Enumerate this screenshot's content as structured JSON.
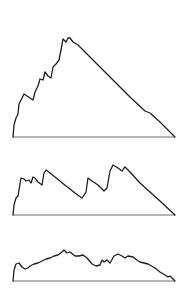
{
  "diagram": {
    "stroke_color": "#1e1e1e",
    "baseline_color": "#6e6e6e",
    "background": "#ffffff",
    "profiles": [
      {
        "name": "tall-excursion",
        "baseline": {
          "x1": 13,
          "x2": 175,
          "y": 137
        },
        "points": "13,137 14,125 16,118 18,114 19,104 24,94 33,100 35,92 38,86 40,79 43,80 45,72 48,76 51,78 53,67 56,64 59,60 61,50 63,39 66,42 68,38 70,38 73,42 78,45 90,57 110,77 130,97 145,111 150,113 160,122 175,137"
      },
      {
        "name": "medium-excursion",
        "baseline": {
          "x1": 13,
          "x2": 175,
          "y": 215
        },
        "points": "13,215 14,205 16,198 18,196 21,178 24,179 26,181 29,180 31,183 33,177 35,178 38,182 42,185 44,173 46,170 50,173 55,177 60,181 66,186 70,189 75,193 79,196 82,198 86,192 88,178 92,181 98,185 104,191 107,188 110,171 113,165 118,168 122,171 124,168 125,167 130,172 140,183 160,201 175,215"
      },
      {
        "name": "low-excursion",
        "baseline": {
          "x1": 13,
          "x2": 175,
          "y": 281
        },
        "points": "13,281 14,270 16,264 19,263 22,267 25,269 28,268 30,266 34,264 38,263 42,261 46,259 50,258 54,256 58,255 62,252 64,250 67,253 70,252 75,256 79,256 83,255 87,258 92,264 96,266 100,265 102,260 104,262 107,260 110,263 114,256 118,254 122,256 125,258 128,256 133,257 137,260 140,262 148,264 155,268 160,272 165,275 168,277 170,276 173,279 175,281"
      }
    ]
  }
}
